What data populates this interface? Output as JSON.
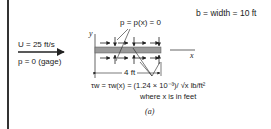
{
  "diagram": {
    "labels": {
      "width": "b = width = 10 ft",
      "pressure_surface": "p = p(x) = 0",
      "freestream_velocity": "U = 25 ft/s",
      "freestream_pressure": "p = 0 (gage)",
      "y_axis": "y",
      "x_axis": "x",
      "plate_length": "4 ft",
      "shear_formula": "τw = τw(x) = (1.24 × 10⁻³)/ √x lb/ft²",
      "shear_note": "where x is in feet",
      "caption": "(a)"
    },
    "colors": {
      "plate": "#9a9a9a",
      "lines": "#222222"
    }
  }
}
